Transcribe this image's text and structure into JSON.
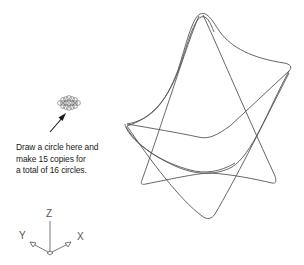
{
  "callout": {
    "lines": [
      "Draw a circle here and",
      "make 15 copies for",
      "a total of 16 circles."
    ]
  },
  "ucs_icon": {
    "z_label": "Z",
    "y_label": "Y",
    "x_label": "X"
  },
  "colors": {
    "line": "#555555",
    "text": "#1a1a1a",
    "background": "#ffffff"
  }
}
